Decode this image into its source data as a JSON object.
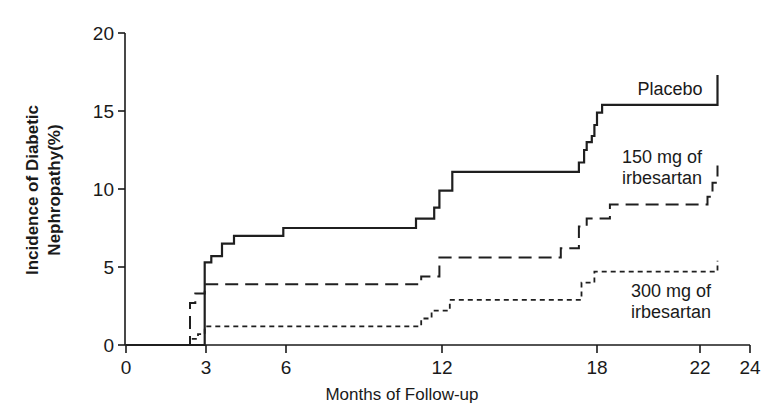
{
  "chart_data": {
    "type": "line",
    "subtype": "step (Kaplan-Meier cumulative incidence)",
    "title": "",
    "xlabel": "Months of Follow-up",
    "ylabel": "Incidence of Diabetic Nephropathy(%)",
    "ylabel_lines": [
      "Incidence of Diabetic",
      "Nephropathy(%)"
    ],
    "xlim": [
      0,
      24
    ],
    "ylim": [
      0,
      20
    ],
    "x_ticks": [
      0,
      3,
      6,
      12,
      18,
      22,
      24
    ],
    "x_tick_labels": [
      "0",
      "3",
      "6",
      "12",
      "18",
      "22",
      "24"
    ],
    "y_ticks": [
      0,
      5,
      10,
      15,
      20
    ],
    "y_tick_labels": [
      "0",
      "5",
      "10",
      "15",
      "20"
    ],
    "grid": false,
    "legend": "inline labels at right",
    "series": [
      {
        "name": "Placebo",
        "label_lines": [
          "Placebo"
        ],
        "style": "solid",
        "points": [
          [
            0,
            0
          ],
          [
            2.95,
            0
          ],
          [
            2.95,
            5.3
          ],
          [
            3.2,
            5.7
          ],
          [
            3.6,
            6.5
          ],
          [
            4.05,
            7.0
          ],
          [
            5.9,
            7.5
          ],
          [
            11.0,
            8.1
          ],
          [
            11.7,
            8.8
          ],
          [
            11.9,
            9.9
          ],
          [
            12.4,
            11.1
          ],
          [
            17.3,
            11.7
          ],
          [
            17.5,
            12.5
          ],
          [
            17.6,
            13.0
          ],
          [
            17.8,
            13.4
          ],
          [
            17.9,
            14.1
          ],
          [
            18.0,
            14.9
          ],
          [
            18.2,
            15.4
          ],
          [
            22.7,
            15.4
          ],
          [
            22.7,
            17.3
          ]
        ]
      },
      {
        "name": "150 mg of irbesartan",
        "label_lines": [
          "150 mg of",
          "irbesartan"
        ],
        "style": "dashed",
        "points": [
          [
            0,
            0
          ],
          [
            2.4,
            0
          ],
          [
            2.4,
            2.7
          ],
          [
            2.6,
            3.3
          ],
          [
            2.95,
            3.9
          ],
          [
            11.2,
            4.4
          ],
          [
            11.9,
            5.6
          ],
          [
            16.6,
            6.2
          ],
          [
            17.3,
            7.6
          ],
          [
            17.6,
            8.1
          ],
          [
            18.5,
            9.0
          ],
          [
            22.3,
            9.5
          ],
          [
            22.5,
            10.4
          ],
          [
            22.7,
            11.5
          ]
        ]
      },
      {
        "name": "300 mg of irbesartan",
        "label_lines": [
          "300 mg of",
          "irbesartan"
        ],
        "style": "dotted",
        "points": [
          [
            0,
            0
          ],
          [
            2.4,
            0
          ],
          [
            2.4,
            0.4
          ],
          [
            2.7,
            0.7
          ],
          [
            2.95,
            1.2
          ],
          [
            11.2,
            1.7
          ],
          [
            11.6,
            2.2
          ],
          [
            12.3,
            2.9
          ],
          [
            17.4,
            4.0
          ],
          [
            17.9,
            4.7
          ],
          [
            22.7,
            4.7
          ],
          [
            22.7,
            5.4
          ]
        ]
      }
    ]
  },
  "layout_px": {
    "x_tick_px": [
      126,
      206,
      286,
      442,
      597,
      700,
      750
    ],
    "y0_px": 345,
    "y20_px": 33,
    "axis_left_px": 125,
    "axis_right_px": 750
  },
  "labels": {
    "placebo": {
      "x": 670,
      "y": 95
    },
    "irb150": {
      "x": 662,
      "y": 163
    },
    "irb300": {
      "x": 671,
      "y": 297
    }
  }
}
